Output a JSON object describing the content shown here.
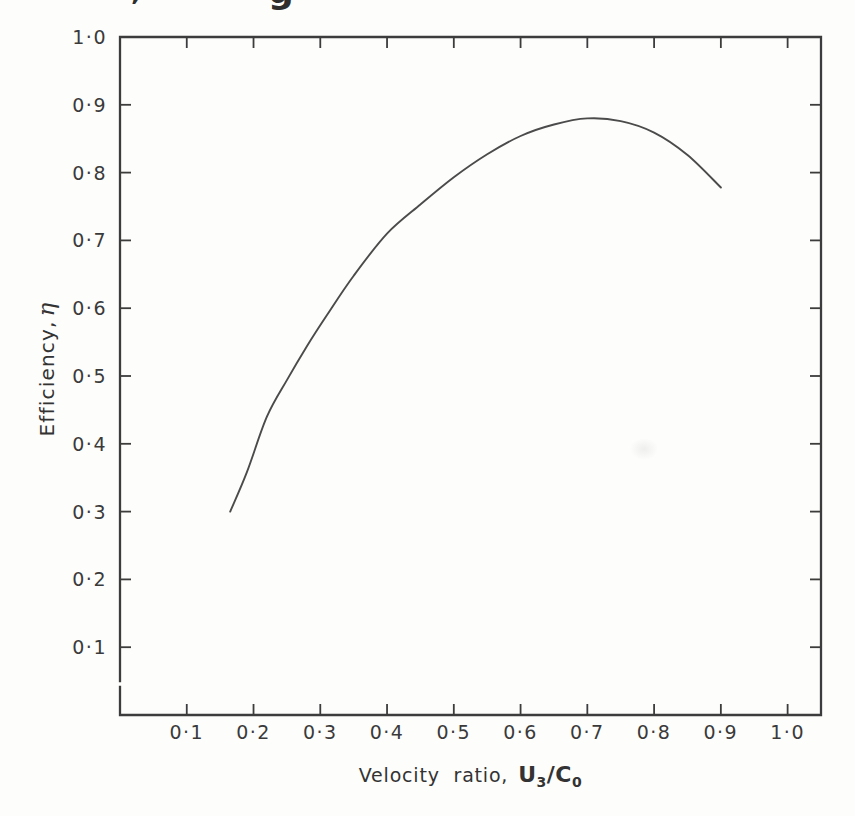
{
  "figure": {
    "background": "#fdfdfb",
    "ink": "#3c3c3c",
    "curve_color": "#4b4b4b",
    "text_color": "#333333"
  },
  "page_fragments": {
    "left": ",",
    "right": "g"
  },
  "chart_data": {
    "type": "line",
    "title": "",
    "xlabel_text": "Velocity ratio, U₃/C₀",
    "ylabel_text": "Efficiency, η",
    "xlabel": {
      "prefix": "Velocity ratio,",
      "num_sym": "U",
      "num_sub": "3",
      "slash": "/",
      "den_sym": "C",
      "den_sub": "0"
    },
    "ylabel": {
      "prefix": "Efficiency,",
      "symbol": "η"
    },
    "xlim": [
      0,
      1.05
    ],
    "ylim": [
      0,
      1.0
    ],
    "grid": false,
    "x_ticks": {
      "values": [
        0.1,
        0.2,
        0.3,
        0.4,
        0.5,
        0.6,
        0.7,
        0.8,
        0.9,
        1.0
      ],
      "labels": [
        "0·1",
        "0·2",
        "0·3",
        "0·4",
        "0·5",
        "0·6",
        "0·7",
        "0·8",
        "0·9",
        "1·0"
      ]
    },
    "y_ticks": {
      "values": [
        1.0,
        0.9,
        0.8,
        0.7,
        0.6,
        0.5,
        0.4,
        0.3,
        0.2,
        0.1
      ],
      "labels": [
        "1·0",
        "0·9",
        "0·8",
        "0·7",
        "0·6",
        "0·5",
        "0·4",
        "0·3",
        "0·2",
        "0·1"
      ]
    },
    "series": [
      {
        "name": "efficiency-curve",
        "points": [
          [
            0.165,
            0.3
          ],
          [
            0.19,
            0.358
          ],
          [
            0.22,
            0.44
          ],
          [
            0.25,
            0.494
          ],
          [
            0.28,
            0.544
          ],
          [
            0.31,
            0.59
          ],
          [
            0.35,
            0.648
          ],
          [
            0.4,
            0.71
          ],
          [
            0.45,
            0.753
          ],
          [
            0.5,
            0.793
          ],
          [
            0.55,
            0.827
          ],
          [
            0.6,
            0.854
          ],
          [
            0.65,
            0.871
          ],
          [
            0.7,
            0.88
          ],
          [
            0.75,
            0.876
          ],
          [
            0.8,
            0.859
          ],
          [
            0.85,
            0.826
          ],
          [
            0.9,
            0.778
          ]
        ]
      }
    ]
  }
}
